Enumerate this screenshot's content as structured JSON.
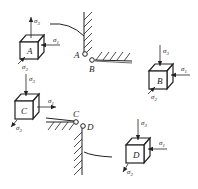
{
  "figure": {
    "points": [
      {
        "id": "A",
        "label": "A"
      },
      {
        "id": "B",
        "label": "B"
      },
      {
        "id": "C",
        "label": "C"
      },
      {
        "id": "D",
        "label": "D"
      }
    ],
    "elements": [
      {
        "id": "A",
        "face_label": "A",
        "stresses": {
          "s1": "σ",
          "s1_sub": "1",
          "s2": "σ",
          "s2_sub": "2",
          "s3": "σ",
          "s3_sub": "3"
        }
      },
      {
        "id": "B",
        "face_label": "B",
        "stresses": {
          "s1": "σ",
          "s1_sub": "1",
          "s2": "σ",
          "s2_sub": "2",
          "s3": "σ",
          "s3_sub": "3"
        }
      },
      {
        "id": "C",
        "face_label": "C",
        "stresses": {
          "s1": "σ",
          "s1_sub": "1",
          "s2": "σ",
          "s2_sub": "2",
          "s3": "σ",
          "s3_sub": "3"
        }
      },
      {
        "id": "D",
        "face_label": "D",
        "stresses": {
          "s1": "σ",
          "s1_sub": "1",
          "s2": "σ",
          "s2_sub": "2",
          "s3": "σ",
          "s3_sub": "3"
        }
      }
    ]
  },
  "colors": {
    "ink": "#222222",
    "background": "#ffffff"
  }
}
